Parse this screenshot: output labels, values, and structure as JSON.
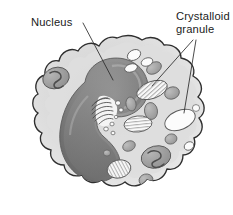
{
  "figure": {
    "background_color": "#ffffff",
    "width": 233,
    "height": 215,
    "cropped_header_text": "",
    "labels": [
      {
        "id": "nucleus",
        "text": "Nucleus",
        "x": 31,
        "y": 26,
        "anchor": "start",
        "target": "nucleus-body"
      },
      {
        "id": "crystalloid-granule-line1",
        "text": "Crystalloid",
        "x": 176,
        "y": 20,
        "anchor": "start",
        "target": "crystalloid-granule-upper"
      },
      {
        "id": "crystalloid-granule-line2",
        "text": "granule",
        "x": 176,
        "y": 33,
        "anchor": "start",
        "target": "crystalloid-granule-lower"
      }
    ],
    "leaders": [
      {
        "id": "leader-nucleus",
        "from": [
          83,
          23
        ],
        "to": [
          113,
          80
        ]
      },
      {
        "id": "leader-granule-upper",
        "from": [
          193,
          40
        ],
        "to": [
          152,
          85
        ]
      },
      {
        "id": "leader-granule-lower",
        "from": [
          196,
          40
        ],
        "to": [
          185,
          113
        ]
      }
    ],
    "colors": {
      "cell_membrane_stroke": "#2f2f2f",
      "cytoplasm_outer": "#e6e6e6",
      "cytoplasm_inner": "#cfcfcf",
      "nucleus_dark": "#6e6e6e",
      "nucleus_mid": "#8c8c8c",
      "nucleus_light": "#b6b6b6",
      "organelle_gray": "#a8a8a8",
      "organelle_stroke": "#5a5a5a",
      "granule_white": "#fbfbfb",
      "granule_stripe": "#8d8d8d",
      "golgi_stroke": "#4a4a4a",
      "label_text": "#1b1b1b",
      "leader_line": "#2b2b2b"
    },
    "structures": [
      {
        "id": "cell-membrane",
        "name": "cell membrane",
        "shape": "wavy-amoeboid-outline"
      },
      {
        "id": "cytoplasm",
        "name": "cytoplasm",
        "shape": "filled-interior"
      },
      {
        "id": "nucleus-body",
        "name": "nucleus",
        "shape": "bilobed-horseshoe",
        "shade": "dark-gray"
      },
      {
        "id": "golgi-apparatus",
        "name": "Golgi apparatus",
        "shape": "stacked-cisternae"
      },
      {
        "id": "mitochondrion-upper-left",
        "name": "mitochondrion",
        "shape": "oval-with-cristae"
      },
      {
        "id": "mitochondrion-lower-right",
        "name": "mitochondrion",
        "shape": "oval-with-cristae"
      },
      {
        "id": "crystalloid-granule-upper",
        "name": "crystalloid granule",
        "shape": "striated-ellipse"
      },
      {
        "id": "crystalloid-granule-lower",
        "name": "crystalloid granule",
        "shape": "white-ellipse"
      },
      {
        "id": "crystalloid-granule-center",
        "name": "crystalloid granule",
        "shape": "striated-ellipse"
      },
      {
        "id": "crystalloid-granule-bottom",
        "name": "crystalloid granule",
        "shape": "striated-ellipse"
      },
      {
        "id": "crystalloid-granule-bottom-flat",
        "name": "crystalloid granule",
        "shape": "striated-rounded-rect"
      },
      {
        "id": "vesicles",
        "name": "vesicles",
        "shape": "small-white-ovals"
      },
      {
        "id": "lysosomes",
        "name": "lysosomes",
        "shape": "small-gray-ovals"
      }
    ]
  }
}
